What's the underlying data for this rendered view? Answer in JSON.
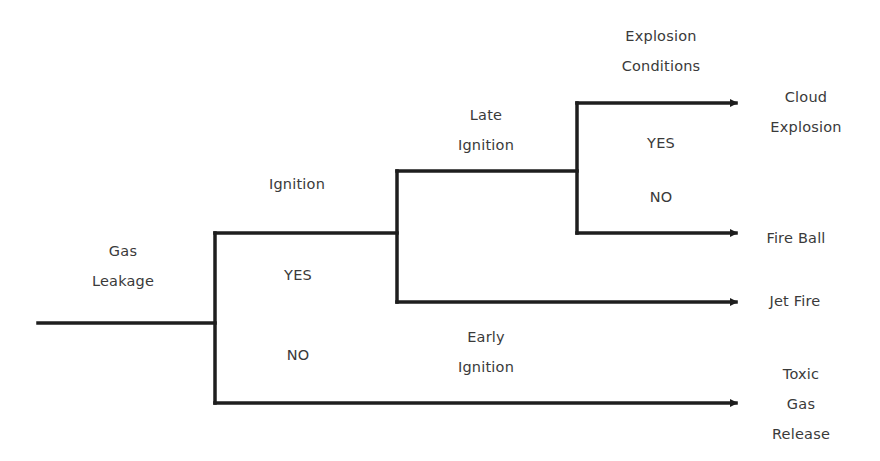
{
  "diagram": {
    "type": "event-tree",
    "line_color": "#1e1e1e",
    "text_color": "#3a3a3a",
    "root": {
      "label": [
        "Gas",
        "Leakage"
      ]
    },
    "stage_headers": [
      {
        "id": "ignition",
        "lines": [
          "Ignition"
        ]
      },
      {
        "id": "late-ignition",
        "lines": [
          "Late",
          "Ignition"
        ]
      },
      {
        "id": "explosion-conditions",
        "lines": [
          "Explosion",
          "Conditions"
        ]
      },
      {
        "id": "early-ignition",
        "lines": [
          "Early",
          "Ignition"
        ]
      }
    ],
    "branch_labels": {
      "ignition_yes": "YES",
      "ignition_no": "NO",
      "explosion_yes": "YES",
      "explosion_no": "NO"
    },
    "outcomes": [
      {
        "id": "cloud-explosion",
        "lines": [
          "Cloud",
          "Explosion"
        ]
      },
      {
        "id": "fire-ball",
        "lines": [
          "Fire Ball"
        ]
      },
      {
        "id": "jet-fire",
        "lines": [
          "Jet Fire"
        ]
      },
      {
        "id": "toxic-gas-release",
        "lines": [
          "Toxic",
          "Gas",
          "Release"
        ]
      }
    ]
  }
}
